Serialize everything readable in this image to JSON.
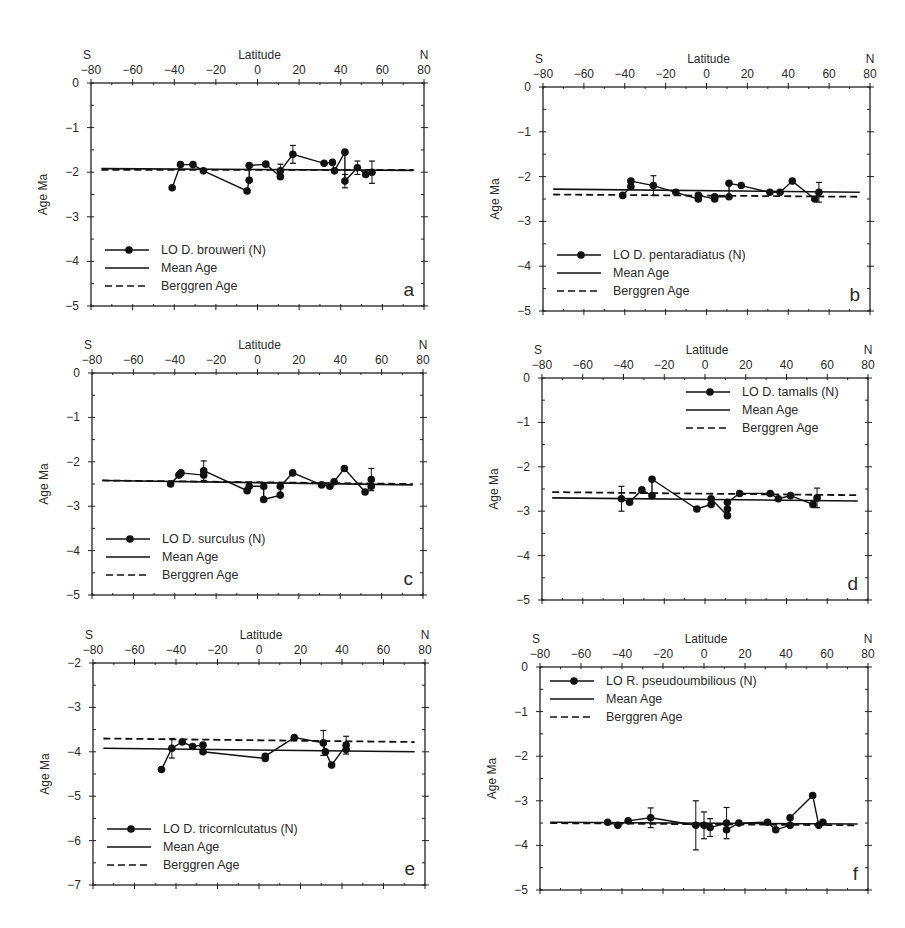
{
  "figure": {
    "top_fragment": "",
    "caption_fragment": ""
  },
  "chart_data": [
    {
      "id": "a",
      "type": "line",
      "panel_label": "a",
      "x_top_left_label": "S",
      "x_top_right_label": "N",
      "xlabel": "Latitude",
      "ylabel": "Age Ma",
      "xlim": [
        -80,
        80
      ],
      "ylim": [
        -5,
        0
      ],
      "xticks": [
        -80,
        -60,
        -40,
        -20,
        0,
        20,
        40,
        60,
        80
      ],
      "yticks": [
        0,
        -1,
        -2,
        -3,
        -4,
        -5
      ],
      "legend_position": "lower-left",
      "legend": [
        "LO D. brouweri (N)",
        "Mean Age",
        "Berggren Age"
      ],
      "series": [
        {
          "name": "LO D. brouweri (N)",
          "style": "line-marker",
          "x": [
            -41,
            -37,
            -31,
            -26,
            -5,
            -4,
            -4,
            4,
            11,
            11,
            17,
            32,
            36,
            37,
            42,
            42,
            48,
            52,
            55
          ],
          "y": [
            -2.35,
            -1.83,
            -1.83,
            -1.97,
            -2.42,
            -2.18,
            -1.85,
            -1.82,
            -2.1,
            -1.97,
            -1.6,
            -1.8,
            -1.78,
            -1.97,
            -1.55,
            -2.2,
            -1.9,
            -2.05,
            -2.0
          ],
          "errors": [
            0,
            0,
            0,
            0,
            0,
            0,
            0,
            0,
            0,
            0.15,
            0.2,
            0,
            0,
            0,
            0,
            0.15,
            0.15,
            0,
            0.25
          ]
        },
        {
          "name": "Mean Age",
          "style": "solid",
          "x": [
            -75,
            75
          ],
          "y": [
            -1.92,
            -1.96
          ]
        },
        {
          "name": "Berggren Age",
          "style": "dashed",
          "x": [
            -75,
            75
          ],
          "y": [
            -1.95,
            -1.95
          ]
        }
      ]
    },
    {
      "id": "b",
      "type": "line",
      "panel_label": "b",
      "x_top_left_label": "S",
      "x_top_right_label": "N",
      "xlabel": "Latitude",
      "ylabel": "Age Ma",
      "xlim": [
        -80,
        80
      ],
      "ylim": [
        -5,
        0
      ],
      "xticks": [
        -80,
        -60,
        -40,
        -20,
        0,
        20,
        40,
        60,
        80
      ],
      "yticks": [
        0,
        -1,
        -2,
        -3,
        -4,
        -5
      ],
      "legend_position": "lower-left",
      "legend": [
        "LO D. pentaradiatus (N)",
        "Mean Age",
        "Berggren Age"
      ],
      "series": [
        {
          "name": "LO D. pentaradiatus (N)",
          "style": "line-marker",
          "x": [
            -41,
            -37,
            -37,
            -26,
            -15,
            -4,
            -4,
            4,
            4,
            11,
            11,
            17,
            31,
            36,
            42,
            53,
            55
          ],
          "y": [
            -2.42,
            -2.22,
            -2.1,
            -2.2,
            -2.35,
            -2.5,
            -2.42,
            -2.5,
            -2.45,
            -2.45,
            -2.15,
            -2.2,
            -2.35,
            -2.35,
            -2.1,
            -2.5,
            -2.35
          ],
          "errors": [
            0,
            0,
            0,
            0.22,
            0,
            0,
            0,
            0,
            0,
            0,
            0,
            0,
            0,
            0,
            0,
            0,
            0.22
          ]
        },
        {
          "name": "Mean Age",
          "style": "solid",
          "x": [
            -75,
            75
          ],
          "y": [
            -2.28,
            -2.35
          ]
        },
        {
          "name": "Berggren Age",
          "style": "dashed",
          "x": [
            -75,
            75
          ],
          "y": [
            -2.4,
            -2.45
          ]
        }
      ]
    },
    {
      "id": "c",
      "type": "line",
      "panel_label": "c",
      "x_top_left_label": "S",
      "x_top_right_label": "N",
      "xlabel": "Latitude",
      "ylabel": "Age Ma",
      "xlim": [
        -80,
        80
      ],
      "ylim": [
        -5,
        0
      ],
      "xticks": [
        -80,
        -60,
        -40,
        -20,
        0,
        20,
        40,
        60,
        80
      ],
      "yticks": [
        0,
        -1,
        -2,
        -3,
        -4,
        -5
      ],
      "legend_position": "lower-left",
      "legend": [
        "LO D. surculus (N)",
        "Mean Age",
        "Berggren Age"
      ],
      "series": [
        {
          "name": "LO D. surculus (N)",
          "style": "line-marker",
          "x": [
            -42,
            -38,
            -37,
            -26,
            -26,
            -5,
            -4,
            3,
            3,
            11,
            11,
            17,
            31,
            35,
            37,
            42,
            52,
            55,
            55
          ],
          "y": [
            -2.5,
            -2.3,
            -2.25,
            -2.3,
            -2.2,
            -2.65,
            -2.55,
            -2.55,
            -2.85,
            -2.75,
            -2.55,
            -2.25,
            -2.52,
            -2.55,
            -2.45,
            -2.15,
            -2.68,
            -2.55,
            -2.4
          ],
          "errors": [
            0,
            0,
            0,
            0,
            0.22,
            0,
            0,
            0,
            0,
            0,
            0,
            0,
            0,
            0,
            0,
            0,
            0,
            0,
            0.25
          ]
        },
        {
          "name": "Mean Age",
          "style": "solid",
          "x": [
            -75,
            75
          ],
          "y": [
            -2.42,
            -2.52
          ]
        },
        {
          "name": "Berggren Age",
          "style": "dashed",
          "x": [
            -75,
            75
          ],
          "y": [
            -2.42,
            -2.5
          ]
        }
      ]
    },
    {
      "id": "d",
      "type": "line",
      "panel_label": "d",
      "x_top_left_label": "S",
      "x_top_right_label": "N",
      "xlabel": "Latitude",
      "ylabel": "Age Ma",
      "xlim": [
        -80,
        80
      ],
      "ylim": [
        -5,
        0
      ],
      "xticks": [
        -80,
        -60,
        -40,
        -20,
        0,
        20,
        40,
        60,
        80
      ],
      "yticks": [
        0,
        -1,
        -2,
        -3,
        -4,
        -5
      ],
      "legend_position": "upper-right",
      "legend": [
        "LO D. tamalls (N)",
        "Mean Age",
        "Berggren Age"
      ],
      "series": [
        {
          "name": "LO D. tamalls (N)",
          "style": "line-marker",
          "x": [
            -41,
            -37,
            -31,
            -26,
            -26,
            -4,
            3,
            3,
            11,
            11,
            11,
            17,
            32,
            36,
            42,
            53,
            55
          ],
          "y": [
            -2.72,
            -2.8,
            -2.52,
            -2.65,
            -2.28,
            -2.95,
            -2.85,
            -2.72,
            -3.1,
            -2.95,
            -2.8,
            -2.6,
            -2.6,
            -2.72,
            -2.65,
            -2.85,
            -2.7
          ],
          "errors": [
            0.28,
            0,
            0,
            0,
            0,
            0,
            0,
            0,
            0,
            0,
            0,
            0,
            0,
            0,
            0,
            0,
            0.22
          ]
        },
        {
          "name": "Mean Age",
          "style": "solid",
          "x": [
            -75,
            75
          ],
          "y": [
            -2.7,
            -2.77
          ]
        },
        {
          "name": "Berggren Age",
          "style": "dashed",
          "x": [
            -75,
            75
          ],
          "y": [
            -2.57,
            -2.64
          ]
        }
      ]
    },
    {
      "id": "e",
      "type": "line",
      "panel_label": "e",
      "x_top_left_label": "S",
      "x_top_right_label": "N",
      "xlabel": "Latitude",
      "ylabel": "Age Ma",
      "xlim": [
        -80,
        80
      ],
      "ylim": [
        -7,
        -2
      ],
      "xticks": [
        -80,
        -60,
        -40,
        -20,
        0,
        20,
        40,
        60,
        80
      ],
      "yticks": [
        -2,
        -3,
        -4,
        -5,
        -6,
        -7
      ],
      "legend_position": "lower-left",
      "legend": [
        "LO D. tricornlcutatus (N)",
        "Mean Age",
        "Berggren Age"
      ],
      "series": [
        {
          "name": "LO D. tricornlcutatus (N)",
          "style": "line-marker",
          "x": [
            -47,
            -42,
            -37,
            -32,
            -27,
            -27,
            3,
            3,
            17,
            31,
            32,
            35,
            42,
            42
          ],
          "y": [
            -4.4,
            -3.92,
            -3.78,
            -3.88,
            -3.85,
            -4.0,
            -4.15,
            -4.1,
            -3.68,
            -3.8,
            -4.0,
            -4.3,
            -3.85,
            -3.95
          ],
          "errors": [
            0,
            0.22,
            0,
            0,
            0,
            0,
            0,
            0,
            0,
            0.28,
            0,
            0,
            0.2,
            0
          ]
        },
        {
          "name": "Mean Age",
          "style": "solid",
          "x": [
            -75,
            75
          ],
          "y": [
            -3.92,
            -4.0
          ]
        },
        {
          "name": "Berggren Age",
          "style": "dashed",
          "x": [
            -75,
            75
          ],
          "y": [
            -3.7,
            -3.78
          ]
        }
      ]
    },
    {
      "id": "f",
      "type": "line",
      "panel_label": "f",
      "x_top_left_label": "S",
      "x_top_right_label": "N",
      "xlabel": "Latitude",
      "ylabel": "Age Ma",
      "xlim": [
        -80,
        80
      ],
      "ylim": [
        -5,
        0
      ],
      "xticks": [
        -80,
        -60,
        -40,
        -20,
        0,
        20,
        40,
        60,
        80
      ],
      "yticks": [
        0,
        -1,
        -2,
        -3,
        -4,
        -5
      ],
      "legend_position": "upper-left",
      "legend": [
        "LO R. pseudoumbilious (N)",
        "Mean Age",
        "Berggren Age"
      ],
      "series": [
        {
          "name": "LO R. pseudoumbilious (N)",
          "style": "line-marker",
          "x": [
            -47,
            -42,
            -37,
            -26,
            -4,
            0,
            3,
            11,
            11,
            17,
            31,
            35,
            42,
            42,
            53,
            56,
            58
          ],
          "y": [
            -3.48,
            -3.55,
            -3.45,
            -3.38,
            -3.55,
            -3.55,
            -3.6,
            -3.5,
            -3.65,
            -3.5,
            -3.48,
            -3.65,
            -3.55,
            -3.38,
            -2.88,
            -3.55,
            -3.48
          ],
          "errors": [
            0,
            0,
            0,
            0.22,
            0.55,
            0.3,
            0.2,
            0.35,
            0,
            0,
            0,
            0,
            0,
            0,
            0,
            0,
            0
          ]
        },
        {
          "name": "Mean Age",
          "style": "solid",
          "x": [
            -75,
            75
          ],
          "y": [
            -3.48,
            -3.52
          ]
        },
        {
          "name": "Berggren Age",
          "style": "dashed",
          "x": [
            -75,
            75
          ],
          "y": [
            -3.5,
            -3.55
          ]
        }
      ]
    }
  ],
  "layout": {
    "panels": [
      {
        "left": 91,
        "top": 83,
        "right": 424,
        "bottom": 306
      },
      {
        "left": 543,
        "top": 87,
        "right": 870,
        "bottom": 311
      },
      {
        "left": 92,
        "top": 373,
        "right": 423,
        "bottom": 595
      },
      {
        "left": 542,
        "top": 378,
        "right": 868,
        "bottom": 600
      },
      {
        "left": 93,
        "top": 663,
        "right": 425,
        "bottom": 885
      },
      {
        "left": 540,
        "top": 667,
        "right": 868,
        "bottom": 890
      }
    ]
  }
}
